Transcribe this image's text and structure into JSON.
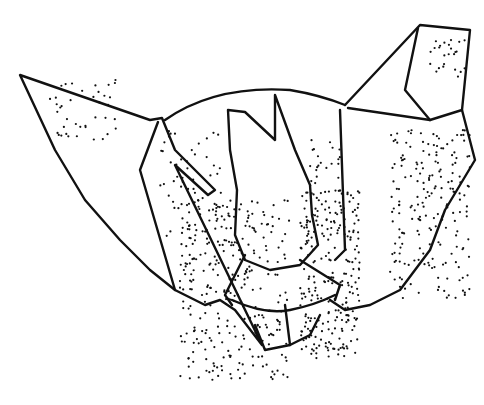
{
  "image": {
    "subject": "bat",
    "style": "black ink line drawing with stippled shading on white background",
    "colors": {
      "ink": "#111111",
      "background": "#ffffff"
    }
  }
}
